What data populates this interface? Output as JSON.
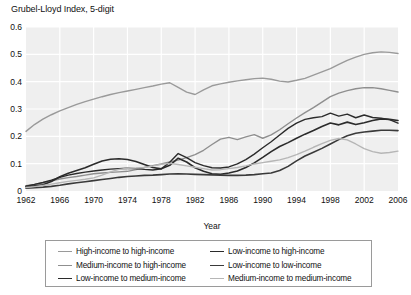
{
  "chart_data": {
    "type": "line",
    "title": "Grubel-Lloyd Index, 5-digit",
    "xlabel": "Year",
    "ylabel": "",
    "xlim": [
      1962,
      2006
    ],
    "ylim": [
      0,
      0.6
    ],
    "grid": true,
    "legend_position": "bottom",
    "xticks": [
      "1962",
      "1966",
      "1970",
      "1974",
      "1978",
      "1982",
      "1986",
      "1990",
      "1994",
      "1998",
      "2002",
      "2006"
    ],
    "yticks": [
      "0",
      "0.1",
      "0.2",
      "0.3",
      "0.4",
      "0.5",
      "0.6"
    ],
    "x": [
      1962,
      1963,
      1964,
      1965,
      1966,
      1967,
      1968,
      1969,
      1970,
      1971,
      1972,
      1973,
      1974,
      1975,
      1976,
      1977,
      1978,
      1979,
      1980,
      1981,
      1982,
      1983,
      1984,
      1985,
      1986,
      1987,
      1988,
      1989,
      1990,
      1991,
      1992,
      1993,
      1994,
      1995,
      1996,
      1997,
      1998,
      1999,
      2000,
      2001,
      2002,
      2003,
      2004,
      2005,
      2006
    ],
    "series": [
      {
        "name": "High-income to high-income",
        "color": "#9a9a9a",
        "width": 1.4,
        "values": [
          0.218,
          0.243,
          0.263,
          0.279,
          0.293,
          0.305,
          0.317,
          0.327,
          0.336,
          0.345,
          0.353,
          0.36,
          0.366,
          0.372,
          0.378,
          0.384,
          0.391,
          0.396,
          0.379,
          0.362,
          0.353,
          0.37,
          0.385,
          0.392,
          0.398,
          0.403,
          0.407,
          0.411,
          0.413,
          0.409,
          0.402,
          0.399,
          0.405,
          0.412,
          0.424,
          0.436,
          0.448,
          0.463,
          0.478,
          0.49,
          0.5,
          0.506,
          0.509,
          0.507,
          0.503
        ]
      },
      {
        "name": "Medium-income to high-income",
        "color": "#8f8f8f",
        "width": 1.4,
        "values": [
          0.019,
          0.024,
          0.03,
          0.037,
          0.044,
          0.049,
          0.053,
          0.058,
          0.063,
          0.066,
          0.068,
          0.07,
          0.072,
          0.078,
          0.086,
          0.093,
          0.099,
          0.106,
          0.113,
          0.122,
          0.133,
          0.149,
          0.17,
          0.19,
          0.196,
          0.188,
          0.198,
          0.206,
          0.193,
          0.205,
          0.224,
          0.246,
          0.267,
          0.287,
          0.305,
          0.325,
          0.345,
          0.358,
          0.367,
          0.374,
          0.378,
          0.378,
          0.374,
          0.368,
          0.362
        ]
      },
      {
        "name": "Low-income to medium-income",
        "color": "#2b2b2b",
        "width": 1.6,
        "values": [
          0.016,
          0.019,
          0.023,
          0.035,
          0.052,
          0.065,
          0.075,
          0.085,
          0.098,
          0.11,
          0.116,
          0.118,
          0.115,
          0.108,
          0.097,
          0.086,
          0.081,
          0.094,
          0.12,
          0.106,
          0.085,
          0.072,
          0.063,
          0.061,
          0.066,
          0.073,
          0.086,
          0.103,
          0.123,
          0.144,
          0.163,
          0.177,
          0.193,
          0.208,
          0.221,
          0.236,
          0.249,
          0.242,
          0.252,
          0.243,
          0.25,
          0.258,
          0.264,
          0.262,
          0.258
        ]
      },
      {
        "name": "Low-income to high-income",
        "color": "#2b2b2b",
        "width": 1.4,
        "values": [
          0.018,
          0.024,
          0.031,
          0.04,
          0.05,
          0.058,
          0.064,
          0.069,
          0.073,
          0.077,
          0.08,
          0.082,
          0.083,
          0.082,
          0.079,
          0.077,
          0.081,
          0.105,
          0.137,
          0.122,
          0.104,
          0.093,
          0.085,
          0.084,
          0.088,
          0.099,
          0.115,
          0.135,
          0.158,
          0.18,
          0.205,
          0.229,
          0.248,
          0.262,
          0.268,
          0.272,
          0.285,
          0.274,
          0.281,
          0.268,
          0.278,
          0.269,
          0.266,
          0.261,
          0.248
        ]
      },
      {
        "name": "Low-income to low-income",
        "color": "#3a3a3a",
        "width": 1.6,
        "values": [
          0.01,
          0.012,
          0.014,
          0.017,
          0.021,
          0.026,
          0.03,
          0.034,
          0.038,
          0.042,
          0.046,
          0.05,
          0.053,
          0.055,
          0.057,
          0.058,
          0.06,
          0.062,
          0.063,
          0.062,
          0.061,
          0.06,
          0.059,
          0.058,
          0.057,
          0.057,
          0.058,
          0.06,
          0.063,
          0.066,
          0.075,
          0.09,
          0.11,
          0.128,
          0.142,
          0.156,
          0.172,
          0.188,
          0.202,
          0.211,
          0.216,
          0.219,
          0.222,
          0.222,
          0.221
        ]
      },
      {
        "name": "Medium-income to medium-income",
        "color": "#b6b6b6",
        "width": 1.4,
        "values": [
          0.013,
          0.016,
          0.02,
          0.025,
          0.03,
          0.035,
          0.039,
          0.043,
          0.048,
          0.058,
          0.07,
          0.079,
          0.083,
          0.084,
          0.086,
          0.091,
          0.098,
          0.101,
          0.097,
          0.092,
          0.087,
          0.082,
          0.077,
          0.078,
          0.082,
          0.086,
          0.092,
          0.099,
          0.104,
          0.109,
          0.114,
          0.122,
          0.133,
          0.146,
          0.16,
          0.173,
          0.185,
          0.192,
          0.187,
          0.172,
          0.155,
          0.144,
          0.138,
          0.141,
          0.146
        ]
      }
    ]
  },
  "legend": {
    "entries": [
      {
        "label": "High-income to high-income",
        "color": "#9a9a9a"
      },
      {
        "label": "Low-income to high-income",
        "color": "#2b2b2b"
      },
      {
        "label": "Medium-income to high-income",
        "color": "#8f8f8f"
      },
      {
        "label": "Low-income to low-income",
        "color": "#3a3a3a"
      },
      {
        "label": "Low-income to medium-income",
        "color": "#2b2b2b"
      },
      {
        "label": "Medium-income to medium-income",
        "color": "#b6b6b6"
      }
    ]
  },
  "style": {
    "plot_background": "#efefef",
    "gridline_color": "#ffffff",
    "axis_text_color": "#111111"
  }
}
